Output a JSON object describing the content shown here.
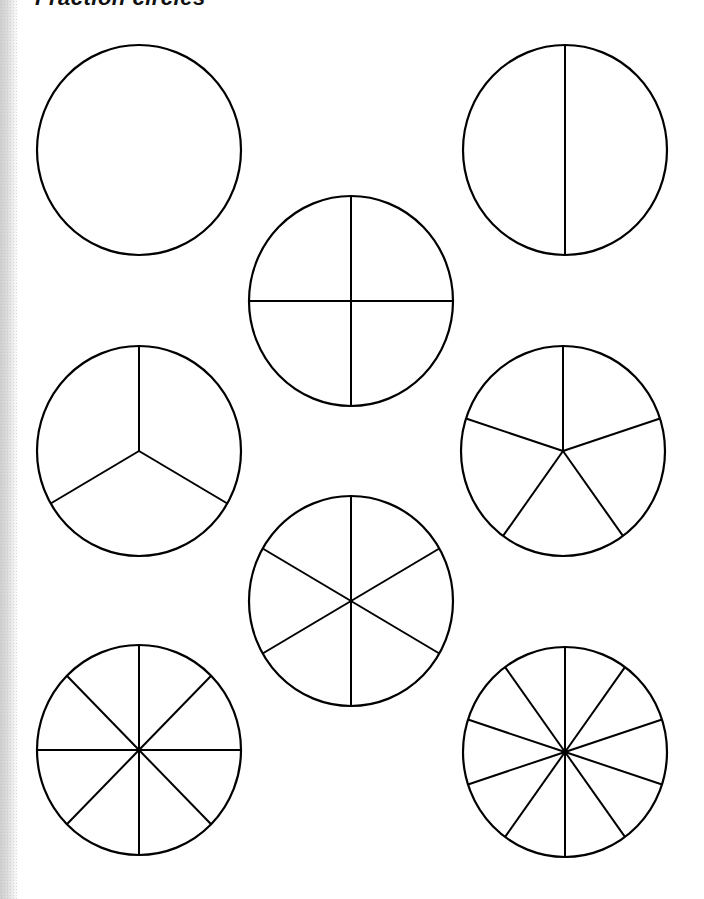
{
  "worksheet": {
    "title": "Fraction circles",
    "stroke_color": "#000000",
    "background_color": "#ffffff"
  },
  "circles": [
    {
      "label": "whole",
      "parts": 1,
      "cx": 139,
      "cy": 150,
      "rx": 102,
      "ry": 105,
      "start_angle_deg": -90
    },
    {
      "label": "halves",
      "parts": 2,
      "cx": 565,
      "cy": 150,
      "rx": 102,
      "ry": 105,
      "start_angle_deg": -90
    },
    {
      "label": "fourths",
      "parts": 4,
      "cx": 351,
      "cy": 301,
      "rx": 102,
      "ry": 105,
      "start_angle_deg": -90
    },
    {
      "label": "thirds",
      "parts": 3,
      "cx": 139,
      "cy": 451,
      "rx": 102,
      "ry": 105,
      "start_angle_deg": -90
    },
    {
      "label": "fifths",
      "parts": 5,
      "cx": 563,
      "cy": 451,
      "rx": 102,
      "ry": 105,
      "start_angle_deg": -90
    },
    {
      "label": "sixths",
      "parts": 6,
      "cx": 351,
      "cy": 601,
      "rx": 102,
      "ry": 105,
      "start_angle_deg": -90
    },
    {
      "label": "eighths",
      "parts": 8,
      "cx": 139,
      "cy": 750,
      "rx": 102,
      "ry": 105,
      "start_angle_deg": -90
    },
    {
      "label": "tenths",
      "parts": 10,
      "cx": 565,
      "cy": 752,
      "rx": 102,
      "ry": 105,
      "start_angle_deg": -90
    }
  ]
}
